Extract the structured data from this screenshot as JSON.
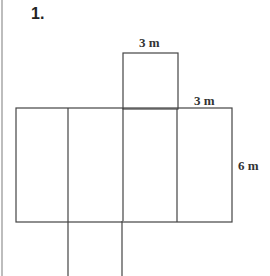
{
  "problem": {
    "number": "1."
  },
  "figure": {
    "type": "net-of-rectangular-prism",
    "labels": {
      "top_width": "3 m",
      "right_width": "3 m",
      "height": "6 m"
    },
    "line_color": "#444444"
  }
}
